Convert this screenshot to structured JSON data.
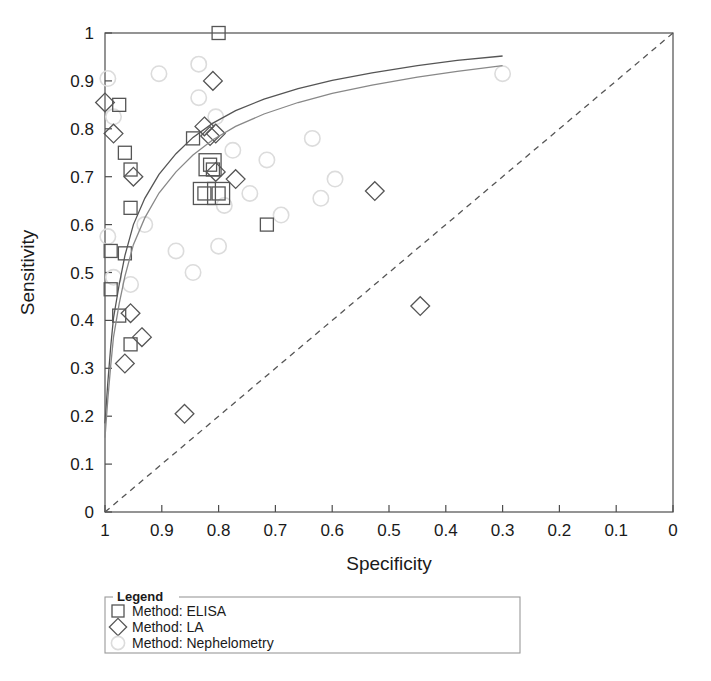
{
  "chart_data": {
    "type": "scatter",
    "title": "",
    "xlabel": "Specificity",
    "ylabel": "Sensitivity",
    "xlim": [
      1,
      0
    ],
    "ylim": [
      0,
      1
    ],
    "x_reversed": true,
    "grid": false,
    "xticks": [
      "1",
      "0.9",
      "0.8",
      "0.7",
      "0.6",
      "0.5",
      "0.4",
      "0.3",
      "0.2",
      "0.1",
      "0"
    ],
    "xtick_values": [
      1,
      0.9,
      0.8,
      0.7,
      0.6,
      0.5,
      0.4,
      0.3,
      0.2,
      0.1,
      0
    ],
    "yticks": [
      "0",
      "0.1",
      "0.2",
      "0.3",
      "0.4",
      "0.5",
      "0.6",
      "0.7",
      "0.8",
      "0.9",
      "1"
    ],
    "ytick_values": [
      0,
      0.1,
      0.2,
      0.3,
      0.4,
      0.5,
      0.6,
      0.7,
      0.8,
      0.9,
      1
    ],
    "legend_position": "below-plot",
    "series": [
      {
        "name": "Method: ELISA",
        "marker": "square",
        "color": "#555555",
        "points": [
          [
            0.8,
            1.0
          ],
          [
            0.975,
            0.85
          ],
          [
            0.965,
            0.75
          ],
          [
            0.955,
            0.715
          ],
          [
            0.955,
            0.635
          ],
          [
            0.965,
            0.54
          ],
          [
            0.99,
            0.545
          ],
          [
            0.99,
            0.465
          ],
          [
            0.975,
            0.41
          ],
          [
            0.955,
            0.35
          ],
          [
            0.845,
            0.78
          ],
          [
            0.815,
            0.725
          ],
          [
            0.81,
            0.715
          ],
          [
            0.825,
            0.665
          ],
          [
            0.8,
            0.665
          ],
          [
            0.715,
            0.6
          ]
        ]
      },
      {
        "name": "Method: LA",
        "marker": "diamond",
        "color": "#555555",
        "points": [
          [
            1.0,
            0.855
          ],
          [
            0.985,
            0.79
          ],
          [
            0.95,
            0.7
          ],
          [
            0.81,
            0.9
          ],
          [
            0.825,
            0.805
          ],
          [
            0.815,
            0.785
          ],
          [
            0.805,
            0.79
          ],
          [
            0.805,
            0.71
          ],
          [
            0.77,
            0.695
          ],
          [
            0.955,
            0.415
          ],
          [
            0.965,
            0.31
          ],
          [
            0.935,
            0.365
          ],
          [
            0.86,
            0.205
          ],
          [
            0.525,
            0.67
          ],
          [
            0.445,
            0.43
          ]
        ]
      },
      {
        "name": "Method: Nephelometry",
        "marker": "circle",
        "color": "#dcdcdc",
        "points": [
          [
            0.905,
            0.915
          ],
          [
            0.835,
            0.935
          ],
          [
            0.835,
            0.865
          ],
          [
            0.805,
            0.825
          ],
          [
            0.995,
            0.905
          ],
          [
            0.985,
            0.825
          ],
          [
            0.995,
            0.575
          ],
          [
            0.93,
            0.6
          ],
          [
            0.775,
            0.755
          ],
          [
            0.745,
            0.665
          ],
          [
            0.715,
            0.735
          ],
          [
            0.69,
            0.62
          ],
          [
            0.635,
            0.78
          ],
          [
            0.595,
            0.695
          ],
          [
            0.3,
            0.915
          ],
          [
            0.985,
            0.49
          ],
          [
            0.955,
            0.475
          ],
          [
            0.875,
            0.545
          ],
          [
            0.845,
            0.5
          ],
          [
            0.8,
            0.555
          ],
          [
            0.79,
            0.64
          ],
          [
            0.62,
            0.655
          ]
        ]
      }
    ],
    "curves": [
      {
        "name": "sroc-curve-upper",
        "color": "#555555",
        "points": [
          [
            1.0,
            0.185
          ],
          [
            0.995,
            0.27
          ],
          [
            0.99,
            0.345
          ],
          [
            0.985,
            0.405
          ],
          [
            0.975,
            0.475
          ],
          [
            0.965,
            0.535
          ],
          [
            0.95,
            0.6
          ],
          [
            0.93,
            0.655
          ],
          [
            0.905,
            0.705
          ],
          [
            0.875,
            0.748
          ],
          [
            0.845,
            0.782
          ],
          [
            0.81,
            0.812
          ],
          [
            0.77,
            0.838
          ],
          [
            0.72,
            0.862
          ],
          [
            0.66,
            0.884
          ],
          [
            0.6,
            0.901
          ],
          [
            0.53,
            0.917
          ],
          [
            0.45,
            0.932
          ],
          [
            0.38,
            0.943
          ],
          [
            0.3,
            0.952
          ]
        ]
      },
      {
        "name": "sroc-curve-lower",
        "color": "#888888",
        "points": [
          [
            1.0,
            0.155
          ],
          [
            0.995,
            0.235
          ],
          [
            0.99,
            0.305
          ],
          [
            0.985,
            0.365
          ],
          [
            0.975,
            0.435
          ],
          [
            0.965,
            0.492
          ],
          [
            0.95,
            0.558
          ],
          [
            0.93,
            0.614
          ],
          [
            0.905,
            0.666
          ],
          [
            0.875,
            0.71
          ],
          [
            0.845,
            0.745
          ],
          [
            0.81,
            0.777
          ],
          [
            0.77,
            0.805
          ],
          [
            0.72,
            0.831
          ],
          [
            0.66,
            0.855
          ],
          [
            0.6,
            0.874
          ],
          [
            0.53,
            0.891
          ],
          [
            0.45,
            0.908
          ],
          [
            0.38,
            0.92
          ],
          [
            0.3,
            0.932
          ]
        ]
      }
    ],
    "reference_line": {
      "name": "diagonal-reference-line",
      "style": "dashed",
      "color": "#555555",
      "from": [
        1,
        0
      ],
      "to": [
        0,
        1
      ]
    }
  },
  "legend": {
    "title": "Legend",
    "entries": [
      {
        "label": "Method: ELISA",
        "marker": "square"
      },
      {
        "label": "Method: LA",
        "marker": "diamond"
      },
      {
        "label": "Method: Nephelometry",
        "marker": "circle"
      }
    ]
  },
  "axes": {
    "x_title": "Specificity",
    "y_title": "Sensitivity"
  }
}
